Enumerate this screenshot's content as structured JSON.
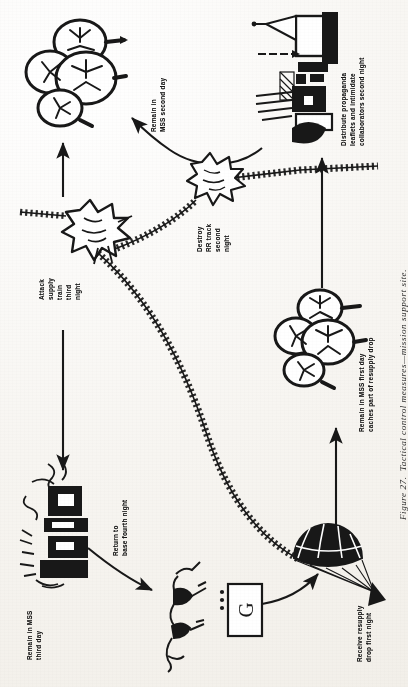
{
  "figure": {
    "caption": "Figure 27.  Tactical control measures—mission support site.",
    "orientation": "rotated-90",
    "ink_color": "#181818",
    "paper_color": "#f7f5f1"
  },
  "nodes": [
    {
      "id": "mss-second-day",
      "icon": "tree-cluster-icon",
      "label": "Remain in\nMSS second day",
      "label_lines": [
        "Remain in",
        "MSS second day"
      ]
    },
    {
      "id": "propaganda-village",
      "icon": "village-buildings-icon",
      "label": "Distribute propaganda\nleaflets and intimidate\ncollaborators second night",
      "label_lines": [
        "Distribute propaganda",
        "leaflets and intimidate",
        "collaborators second night"
      ]
    },
    {
      "id": "attack-supply-train",
      "icon": "explosion-icon",
      "label": "Attack\nsupply\ntrain\nthird\nnight",
      "label_lines": [
        "Attack",
        "supply",
        "train",
        "third",
        "night"
      ]
    },
    {
      "id": "destroy-rr-track",
      "icon": "explosion-icon",
      "label": "Destroy\nRR track\nsecond\nnight",
      "label_lines": [
        "Destroy",
        "RR track",
        "second",
        "night"
      ]
    },
    {
      "id": "mss-first-day",
      "icon": "tree-cluster-icon",
      "label": "Remain in MSS first day\ncaches part of resupply drop",
      "label_lines": [
        "Remain in MSS first day",
        "caches part of resupply drop"
      ]
    },
    {
      "id": "receive-resupply-drop",
      "icon": "parachute-icon",
      "label": "Receive resupply\ndrop first night",
      "label_lines": [
        "Receive resupply",
        "drop first night"
      ]
    },
    {
      "id": "mss-third-day",
      "icon": "village-buildings-icon",
      "label": "Remain in MSS\nthird day",
      "label_lines": [
        "Remain in MSS",
        "third day"
      ]
    },
    {
      "id": "return-to-base",
      "icon": "guerrilla-figures-icon",
      "label": "Return to\nbase fourth night",
      "label_lines": [
        "Return to",
        "base fourth night"
      ]
    },
    {
      "id": "guerrilla-base-symbol",
      "icon": "military-unit-box-icon",
      "label": "G",
      "label_lines": [
        "G"
      ],
      "echelon_dots": 3
    }
  ],
  "connectors": [
    {
      "id": "arrow-village-to-mss2",
      "type": "curved-arrow",
      "from": "propaganda-village",
      "to": "mss-second-day"
    },
    {
      "id": "arrow-train-to-mss2",
      "type": "straight-arrow",
      "from": "attack-supply-train",
      "to": "mss-second-day"
    },
    {
      "id": "arrow-mss1-to-village",
      "type": "straight-arrow",
      "from": "mss-first-day",
      "to": "propaganda-village"
    },
    {
      "id": "arrow-drop-to-mss1",
      "type": "straight-arrow",
      "from": "receive-resupply-drop",
      "to": "mss-first-day"
    },
    {
      "id": "arrow-base-to-drop",
      "type": "curved-arrow",
      "from": "guerrilla-base-symbol",
      "to": "receive-resupply-drop"
    },
    {
      "id": "arrow-mss3-to-return",
      "type": "curved-arrow",
      "from": "mss-third-day",
      "to": "return-to-base"
    },
    {
      "id": "arrow-train-to-mss3",
      "type": "straight-arrow",
      "from": "attack-supply-train",
      "to": "mss-third-day"
    },
    {
      "id": "railroad-main",
      "type": "railroad-track",
      "from": "attack-supply-train",
      "to": "destroy-rr-track"
    },
    {
      "id": "railroad-branch",
      "type": "railroad-track",
      "from": "destroy-rr-track",
      "to": "return-to-base"
    }
  ]
}
